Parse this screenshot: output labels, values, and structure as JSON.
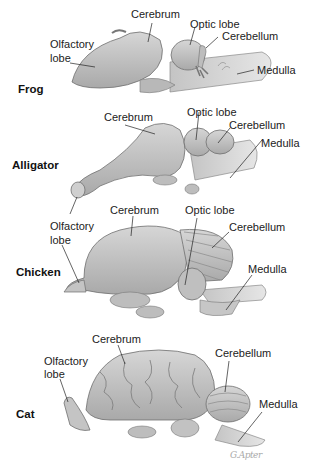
{
  "figure": {
    "signature": "G.Apter",
    "panels": [
      {
        "animal": "Frog",
        "labels": {
          "cerebrum": "Cerebrum",
          "optic_lobe": "Optic lobe",
          "cerebellum": "Cerebellum",
          "medulla": "Medulla",
          "olfactory_1": "Olfactory",
          "olfactory_2": "lobe"
        }
      },
      {
        "animal": "Alligator",
        "labels": {
          "cerebrum": "Cerebrum",
          "optic_lobe": "Optic lobe",
          "cerebellum": "Cerebellum",
          "medulla": "Medulla",
          "olfactory_1": "Olfactory",
          "olfactory_2": "lobe"
        }
      },
      {
        "animal": "Chicken",
        "labels": {
          "cerebrum": "Cerebrum",
          "optic_lobe": "Optic lobe",
          "cerebellum": "Cerebellum",
          "medulla": "Medulla"
        }
      },
      {
        "animal": "Cat",
        "labels": {
          "cerebrum": "Cerebrum",
          "cerebellum": "Cerebellum",
          "medulla": "Medulla",
          "olfactory_1": "Olfactory",
          "olfactory_2": "lobe"
        }
      }
    ],
    "colors": {
      "brain_fill": "#c9c9c9",
      "brain_shade": "#a8a8a8",
      "outline": "#6e6e6e",
      "leader": "#222222"
    }
  }
}
